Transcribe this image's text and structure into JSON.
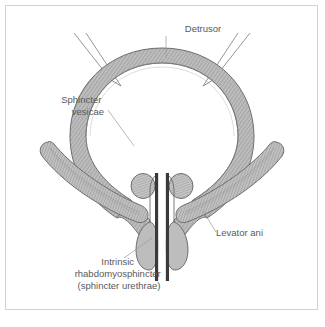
{
  "figure": {
    "frame_border_color": "#d2d2d2",
    "background_color": "#ffffff"
  },
  "palette": {
    "muscle_fill": "#b9b9b9",
    "muscle_outline": "#6e6e6e",
    "hatch_line": "#8d8d8d",
    "urethra_wall": "#3a3a3a",
    "label_color": "#58595b",
    "leader_color": "#9a9a9a",
    "lumen_fill": "#ffffff"
  },
  "labels": [
    {
      "id": "detrusor",
      "lines": [
        "Detrusor"
      ],
      "anchor": "middle",
      "x": 203,
      "y": 32,
      "target_x": 166,
      "target_y": 57
    },
    {
      "id": "sphincter-vesicae",
      "lines": [
        "Sphincter",
        "vesicae"
      ],
      "anchor": "end",
      "x": 104,
      "y": 103,
      "target_x": 131,
      "target_y": 144
    },
    {
      "id": "levator-ani",
      "lines": [
        "Levator ani"
      ],
      "anchor": "start",
      "x": 216,
      "y": 236,
      "target_x": 206,
      "target_y": 213
    },
    {
      "id": "intrinsic-rhabdomyosphincter",
      "lines": [
        "Intrinsic",
        "rhabdomyosphincter",
        "(sphincter urethrae)"
      ],
      "anchor": "middle",
      "x": 119,
      "y": 265,
      "target_x": 151,
      "target_y": 239
    }
  ],
  "structures": {
    "bladder": {
      "name": "detrusor-bladder-wall",
      "description": "thick hatched muscular ring forming the bladder body"
    },
    "ureters": {
      "name": "ureters",
      "count": 2,
      "description": "paired thin tubes entering the bladder superolaterally"
    },
    "sphincter_vesicae": {
      "name": "sphincter-vesicae",
      "count": 2,
      "description": "paired rounded masses at the bladder neck"
    },
    "rhabdomyosphincter": {
      "name": "intrinsic-rhabdomyosphincter",
      "count": 2,
      "description": "paired teardrop striated muscle bodies flanking the urethra"
    },
    "levator_ani": {
      "name": "levator-ani",
      "count": 2,
      "description": "paired elongated curved muscle bands forming the pelvic floor"
    },
    "urethra": {
      "name": "urethra",
      "description": "central channel with dark walls descending from the bladder neck"
    }
  }
}
